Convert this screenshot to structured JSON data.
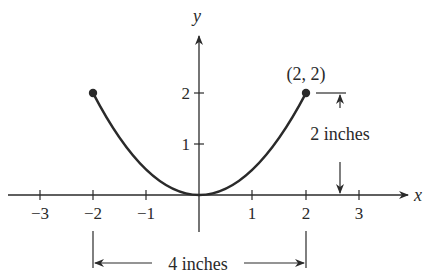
{
  "figure": {
    "axes": {
      "x_label": "x",
      "y_label": "y",
      "x_ticks": [
        "−3",
        "−2",
        "−1",
        "1",
        "2",
        "3"
      ],
      "y_ticks": [
        "1",
        "2"
      ]
    },
    "curve": {
      "equation": "y = x^2 / 2",
      "domain": [
        -2,
        2
      ],
      "endpoints": [
        [
          -2,
          2
        ],
        [
          2,
          2
        ]
      ]
    },
    "point_label": "(2, 2)",
    "vertical_dimension_label": "2 inches",
    "horizontal_dimension_label": "4 inches",
    "colors": {
      "ink": "#2a2a2a",
      "background": "#ffffff"
    }
  }
}
